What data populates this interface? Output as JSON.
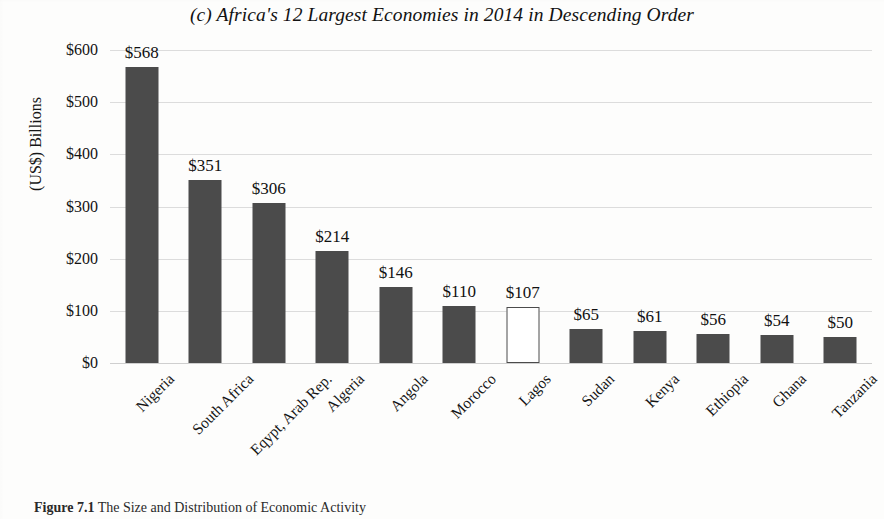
{
  "figure": {
    "caption_label": "Figure 7.1",
    "caption_text": "The Size and Distribution of Economic Activity"
  },
  "chart_data": {
    "type": "bar",
    "title": "(c) Africa's 12 Largest Economies in 2014 in Descending Order",
    "xlabel": "",
    "ylabel": "(US$) Billions",
    "ylim": [
      0,
      600
    ],
    "ytick_values": [
      0,
      100,
      200,
      300,
      400,
      500,
      600
    ],
    "ytick_labels": [
      "$0",
      "$100",
      "$200",
      "$300",
      "$400",
      "$500",
      "$600"
    ],
    "grid": true,
    "legend": "none",
    "categories": [
      "Nigeria",
      "South Africa",
      "Eqypt, Arab Rep.",
      "Algeria",
      "Angola",
      "Morocco",
      "Lagos",
      "Sudan",
      "Kenya",
      "Ethiopia",
      "Ghana",
      "Tanzania"
    ],
    "values": [
      568,
      351,
      306,
      214,
      146,
      110,
      107,
      65,
      61,
      56,
      54,
      50
    ],
    "value_labels": [
      "$568",
      "$351",
      "$306",
      "$214",
      "$146",
      "$110",
      "$107",
      "$65",
      "$61",
      "$56",
      "$54",
      "$50"
    ],
    "bar_styles": [
      "filled",
      "filled",
      "filled",
      "filled",
      "filled",
      "filled",
      "hollow",
      "filled",
      "filled",
      "filled",
      "filled",
      "filled"
    ],
    "colors": {
      "bar_fill": "#4b4b4b",
      "bar_hollow_fill": "#ffffff",
      "bar_outline": "#4b4b4b",
      "gridline": "#dcdcdc",
      "text": "#111111",
      "background": "#fdfdfc"
    }
  }
}
